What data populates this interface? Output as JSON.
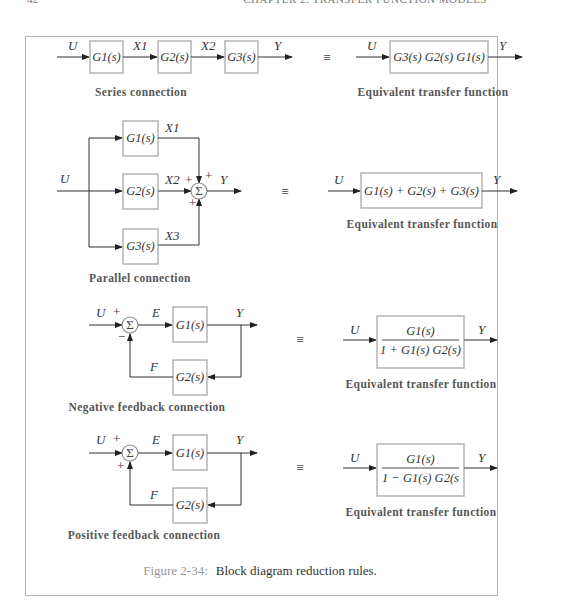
{
  "page_header": {
    "page_number": "42",
    "chapter_title": "CHAPTER 2. TRANSFER FUNCTION MODELS"
  },
  "figure": {
    "label": "Figure 2-34:",
    "caption": "Block diagram reduction rules.",
    "equivalence_symbol": "≡",
    "rules": [
      {
        "name": "series",
        "caption": "Series connection",
        "input": "U",
        "output": "Y",
        "blocks": [
          "G1(s)",
          "G2(s)",
          "G3(s)"
        ],
        "signals": [
          "X1",
          "X2"
        ],
        "equivalent": {
          "caption": "Equivalent transfer function",
          "input": "U",
          "output": "Y",
          "expression": "G3(s) G2(s) G1(s)"
        }
      },
      {
        "name": "parallel",
        "caption": "Parallel connection",
        "input": "U",
        "output": "Y",
        "blocks": [
          "G1(s)",
          "G2(s)",
          "G3(s)"
        ],
        "signals": [
          "X1",
          "X2",
          "X3"
        ],
        "summing_signs": [
          "+",
          "+",
          "+"
        ],
        "equivalent": {
          "caption": "Equivalent transfer function",
          "input": "U",
          "output": "Y",
          "expression": "G1(s) + G2(s) + G3(s)"
        }
      },
      {
        "name": "negative-feedback",
        "caption": "Negative feedback connection",
        "input": "U",
        "output": "Y",
        "error": "E",
        "feedback": "F",
        "forward_block": "G1(s)",
        "feedback_block": "G2(s)",
        "summing_signs": [
          "+",
          "−"
        ],
        "equivalent": {
          "caption": "Equivalent transfer function",
          "input": "U",
          "output": "Y",
          "numerator": "G1(s)",
          "denominator": "1 + G1(s) G2(s)"
        }
      },
      {
        "name": "positive-feedback",
        "caption": "Positive feedback connection",
        "input": "U",
        "output": "Y",
        "error": "E",
        "feedback": "F",
        "forward_block": "G1(s)",
        "feedback_block": "G2(s)",
        "summing_signs": [
          "+",
          "+"
        ],
        "equivalent": {
          "caption": "Equivalent transfer function",
          "input": "U",
          "output": "Y",
          "numerator": "G1(s)",
          "denominator": "1 − G1(s) G2(s"
        }
      }
    ]
  }
}
